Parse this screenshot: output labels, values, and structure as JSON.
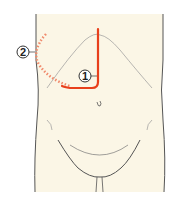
{
  "diagram": {
    "colors": {
      "skin": "#fbf6e6",
      "outline": "#555555",
      "incision": "#e8401c",
      "incision_dotted": "#f08a6c",
      "background": "#ffffff"
    },
    "labels": [
      {
        "id": "1",
        "text": "1",
        "description": "L-shaped incision (solid line)"
      },
      {
        "id": "2",
        "text": "2",
        "description": "curved subcostal extension (dotted line)"
      }
    ]
  }
}
